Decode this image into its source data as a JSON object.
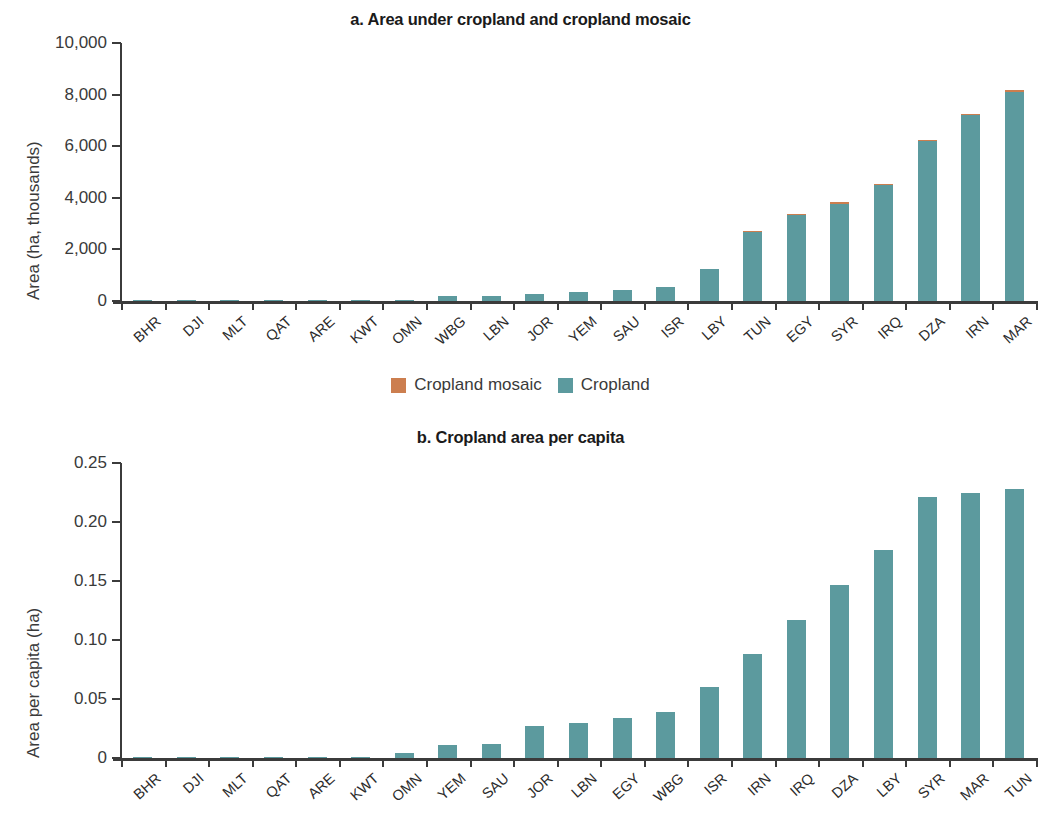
{
  "colors": {
    "cropland": "#5c9a9e",
    "cropland_mosaic": "#cc7e4f",
    "axis": "#3b3b3b",
    "text": "#2b2b2b"
  },
  "legend": {
    "items": [
      {
        "label": "Cropland mosaic",
        "color": "#cc7e4f"
      },
      {
        "label": "Cropland",
        "color": "#5c9a9e"
      }
    ]
  },
  "panel_a": {
    "title": "a. Area under cropland and cropland mosaic",
    "ylabel": "Area (ha, thousands)",
    "yticks": [
      "10,000",
      "8,000",
      "6,000",
      "4,000",
      "2,000",
      "0"
    ]
  },
  "panel_b": {
    "title": "b. Cropland area per capita",
    "ylabel": "Area per capita (ha)",
    "yticks": [
      "0.25",
      "0.20",
      "0.15",
      "0.10",
      "0.05",
      "0"
    ]
  },
  "chart_data": [
    {
      "type": "bar",
      "title": "a. Area under cropland and cropland mosaic",
      "xlabel": "",
      "ylabel": "Area (ha, thousands)",
      "ylim": [
        0,
        10000
      ],
      "ytick_values": [
        0,
        2000,
        4000,
        6000,
        8000,
        10000
      ],
      "ytick_labels": [
        "0",
        "2,000",
        "4,000",
        "6,000",
        "8,000",
        "10,000"
      ],
      "grid": false,
      "stacked": true,
      "legend": [
        "Cropland mosaic",
        "Cropland"
      ],
      "legend_position": "bottom-center",
      "categories": [
        "BHR",
        "DJI",
        "MLT",
        "QAT",
        "ARE",
        "KWT",
        "OMN",
        "WBG",
        "LBN",
        "JOR",
        "YEM",
        "SAU",
        "ISR",
        "LBY",
        "TUN",
        "EGY",
        "SYR",
        "IRQ",
        "DZA",
        "IRN",
        "MAR"
      ],
      "series": [
        {
          "name": "Cropland",
          "color": "#5c9a9e",
          "values": [
            2,
            3,
            5,
            8,
            10,
            12,
            40,
            180,
            210,
            270,
            350,
            430,
            530,
            1230,
            2680,
            3320,
            3750,
            4480,
            6200,
            7200,
            8120
          ]
        },
        {
          "name": "Cropland mosaic",
          "color": "#cc7e4f",
          "values": [
            0,
            0,
            0,
            0,
            0,
            0,
            0,
            0,
            0,
            0,
            0,
            0,
            0,
            0,
            10,
            45,
            70,
            15,
            15,
            10,
            20
          ]
        }
      ]
    },
    {
      "type": "bar",
      "title": "b. Cropland area per capita",
      "xlabel": "",
      "ylabel": "Area per capita (ha)",
      "ylim": [
        0,
        0.25
      ],
      "ytick_values": [
        0,
        0.05,
        0.1,
        0.15,
        0.2,
        0.25
      ],
      "ytick_labels": [
        "0",
        "0.05",
        "0.10",
        "0.15",
        "0.20",
        "0.25"
      ],
      "grid": false,
      "stacked": false,
      "categories": [
        "BHR",
        "DJI",
        "MLT",
        "QAT",
        "ARE",
        "KWT",
        "OMN",
        "YEM",
        "SAU",
        "JOR",
        "LBN",
        "EGY",
        "WBG",
        "ISR",
        "IRN",
        "IRQ",
        "DZA",
        "LBY",
        "SYR",
        "MAR",
        "TUN"
      ],
      "series": [
        {
          "name": "Cropland area per capita",
          "color": "#5c9a9e",
          "values": [
            0.0002,
            0.0004,
            0.0006,
            0.0008,
            0.001,
            0.0012,
            0.004,
            0.011,
            0.012,
            0.027,
            0.03,
            0.034,
            0.039,
            0.06,
            0.088,
            0.117,
            0.147,
            0.176,
            0.221,
            0.225,
            0.228
          ]
        }
      ]
    }
  ]
}
